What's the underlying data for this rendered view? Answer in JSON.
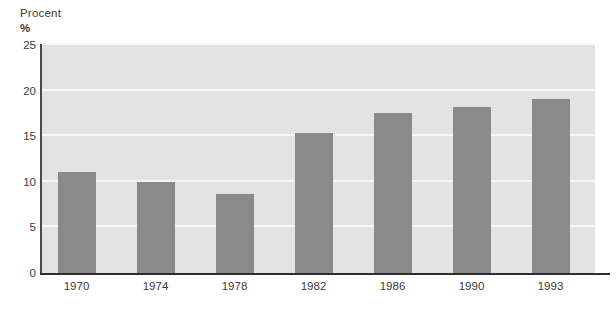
{
  "chart_data": {
    "type": "bar",
    "title": "",
    "subtitle": "",
    "ylabel": "Procent",
    "yunit": "%",
    "xlabel": "",
    "categories": [
      "1970",
      "1974",
      "1978",
      "1982",
      "1986",
      "1990",
      "1993"
    ],
    "values": [
      11.1,
      10.0,
      8.7,
      15.3,
      17.5,
      18.2,
      19.1
    ],
    "ylim": [
      0,
      25
    ],
    "yticks": [
      0,
      5,
      10,
      15,
      20,
      25
    ],
    "ytick_labels": [
      "0",
      "5",
      "10",
      "15",
      "20",
      "25"
    ],
    "grid": true,
    "grid_axis": "y",
    "legend": null,
    "annotations": [],
    "colors": {
      "bar": "#8a8a8a",
      "plot_background": "#e3e3e3",
      "gridline": "#f7f7f7",
      "axis": "#2e2e2e",
      "text": "#3a3a3a",
      "page_background": "#ffffff"
    }
  }
}
